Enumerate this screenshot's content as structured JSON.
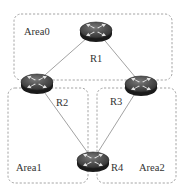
{
  "diagram": {
    "type": "ospf-multi-area-topology",
    "areas": [
      {
        "id": "area0",
        "label": "Area0",
        "x": 14,
        "y": 14,
        "w": 158,
        "h": 66,
        "label_x": 24,
        "label_y": 35
      },
      {
        "id": "area1",
        "label": "Area1",
        "x": 8,
        "y": 88,
        "w": 80,
        "h": 95,
        "label_x": 16,
        "label_y": 171
      },
      {
        "id": "area2",
        "label": "Area2",
        "x": 97,
        "y": 88,
        "w": 79,
        "h": 95,
        "label_x": 139,
        "label_y": 171
      }
    ],
    "routers": [
      {
        "id": "r1",
        "label": "R1",
        "cx": 96,
        "cy": 30,
        "label_x": 90,
        "label_y": 62
      },
      {
        "id": "r2",
        "label": "R2",
        "cx": 37,
        "cy": 82,
        "label_x": 56,
        "label_y": 106
      },
      {
        "id": "r3",
        "label": "R3",
        "cx": 141,
        "cy": 84,
        "label_x": 110,
        "label_y": 105
      },
      {
        "id": "r4",
        "label": "R4",
        "cx": 93,
        "cy": 160,
        "label_x": 111,
        "label_y": 171
      }
    ],
    "links": [
      {
        "from": "R1",
        "to": "R2"
      },
      {
        "from": "R1",
        "to": "R3"
      },
      {
        "from": "R2",
        "to": "R4"
      },
      {
        "from": "R3",
        "to": "R4"
      }
    ],
    "colors": {
      "area_border": "#9a9a9a",
      "link": "#8a8a8a",
      "router_body": "#3a3a3a",
      "router_arrows": "#e8e8e8",
      "text": "#333333"
    }
  }
}
